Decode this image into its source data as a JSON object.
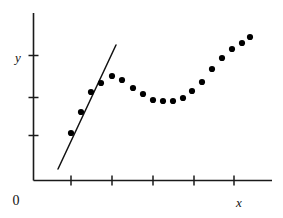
{
  "figure": {
    "title": "",
    "origin_label": "0"
  },
  "chart_data": {
    "type": "scatter",
    "title": "",
    "subtitle": "",
    "xlabel": "x",
    "ylabel": "y",
    "xlim": [
      0,
      6
    ],
    "ylim": [
      0,
      4.2
    ],
    "grid": false,
    "legend": null,
    "annotations": [],
    "axis": {
      "x_axis_visible": true,
      "y_axis_visible": true,
      "x_ticks": [
        1,
        2,
        3,
        4,
        5,
        6
      ],
      "x_tick_labels": [
        "",
        "",
        "",
        "",
        "",
        ""
      ],
      "y_ticks": [
        1,
        2,
        3
      ],
      "y_tick_labels": [
        "",
        "",
        ""
      ],
      "x_tick_pixels": [
        71,
        112,
        153,
        194,
        234,
        272
      ],
      "y_tick_pixels": [
        135,
        97,
        55
      ]
    },
    "series": [
      {
        "name": "observations",
        "marker": "circle",
        "marker_color": "#000000",
        "marker_radius_px": 3.1,
        "points_px": [
          [
            71,
            133
          ],
          [
            81,
            112
          ],
          [
            91,
            92
          ],
          [
            101,
            83
          ],
          [
            112,
            76
          ],
          [
            122,
            80
          ],
          [
            133,
            88
          ],
          [
            143,
            94
          ],
          [
            153,
            100
          ],
          [
            163,
            101
          ],
          [
            173,
            101
          ],
          [
            183,
            98
          ],
          [
            192,
            91
          ],
          [
            202,
            82
          ],
          [
            212,
            69
          ],
          [
            222,
            58
          ],
          [
            232,
            49
          ],
          [
            242,
            43
          ],
          [
            250,
            37
          ]
        ],
        "x": [
          1.0,
          1.25,
          1.5,
          1.75,
          2.0,
          2.25,
          2.5,
          2.75,
          3.0,
          3.25,
          3.5,
          3.75,
          4.0,
          4.25,
          4.5,
          4.75,
          5.0,
          5.25,
          5.45
        ],
        "y": [
          1.13,
          1.5,
          1.85,
          2.01,
          2.13,
          2.06,
          1.92,
          1.82,
          1.71,
          1.69,
          1.69,
          1.74,
          1.86,
          2.01,
          2.25,
          2.44,
          2.6,
          2.71,
          2.82
        ]
      },
      {
        "name": "fitted-line",
        "type": "line",
        "line_color": "#111111",
        "endpoints_px": [
          [
            58,
            169
          ],
          [
            116,
            45
          ]
        ],
        "x_range": [
          0.65,
          2.1
        ],
        "y_range": [
          0.52,
          2.67
        ]
      }
    ]
  }
}
